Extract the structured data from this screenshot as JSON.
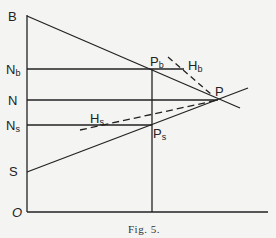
{
  "figure": {
    "caption": "Fig. 5.",
    "axis_labels": {
      "B": "B",
      "Nb": "N",
      "Nb_sub": "b",
      "N": "N",
      "Ns": "N",
      "Ns_sub": "s",
      "S": "S",
      "O": "O"
    },
    "point_labels": {
      "Pb": "P",
      "Pb_sub": "b",
      "P": "P",
      "Ps": "P",
      "Ps_sub": "s",
      "Hb": "H",
      "Hb_sub": "b",
      "Hs": "H",
      "Hs_sub": "s"
    },
    "colors": {
      "ink": "#222222",
      "paper": "#f4f4f2"
    }
  }
}
